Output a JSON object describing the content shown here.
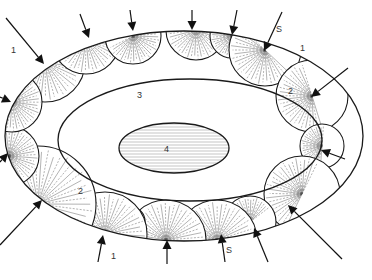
{
  "figure": {
    "labels": {
      "region_1_top_left": "1",
      "region_1_top_right": "1",
      "region_1_bottom": "1",
      "region_2_right": "2",
      "region_2_left": "2",
      "region_3": "3",
      "region_4": "4",
      "marker_s_top": "S",
      "marker_s_bottom": "S"
    },
    "arrow_count": 17,
    "colors": {
      "line": "#1a1a1a",
      "hatch": "#555555",
      "background": "#ffffff"
    }
  }
}
